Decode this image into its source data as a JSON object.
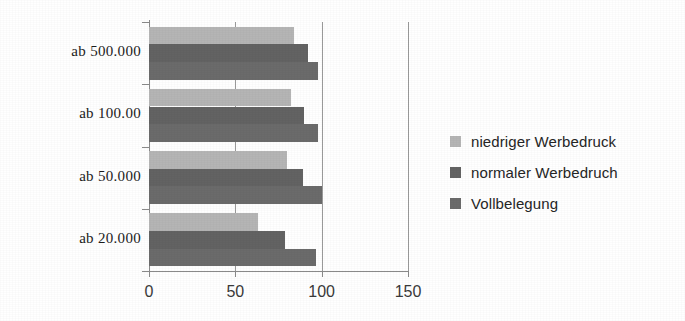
{
  "chart_data": {
    "type": "bar",
    "orientation": "horizontal",
    "title": "",
    "subtitle": "",
    "xlabel": "",
    "ylabel": "",
    "xlim": [
      0,
      150
    ],
    "xticks": [
      0,
      50,
      100,
      150
    ],
    "xtick_labels": [
      "0",
      "50",
      "100",
      "150"
    ],
    "grid": "vertical",
    "legend_position": "right",
    "categories": [
      "ab 500.000",
      "ab 100.00",
      "ab 50.000",
      "ab 20.000"
    ],
    "series": [
      {
        "name": "niedriger Werbedruck",
        "color": "#b5b5b5",
        "values": [
          84,
          82,
          80,
          63
        ]
      },
      {
        "name": "normaler Werbedruch",
        "color": "#636363",
        "values": [
          92,
          90,
          89,
          79
        ]
      },
      {
        "name": "Vollbelegung",
        "color": "#6b6b6b",
        "values": [
          98,
          98,
          100,
          97
        ]
      }
    ]
  },
  "legend": {
    "items": [
      {
        "label": "niedriger Werbedruck",
        "color": "#b5b5b5"
      },
      {
        "label": "normaler Werbedruch",
        "color": "#636363"
      },
      {
        "label": "Vollbelegung",
        "color": "#6b6b6b"
      }
    ]
  },
  "axes": {
    "y_categories": [
      "ab 500.000",
      "ab 100.00",
      "ab 50.000",
      "ab 20.000"
    ],
    "x_tick_labels": [
      "0",
      "50",
      "100",
      "150"
    ]
  }
}
